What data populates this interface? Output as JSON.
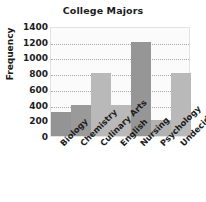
{
  "chart_data": {
    "type": "bar",
    "title": "College Majors",
    "xlabel": "",
    "ylabel": "Frequency",
    "categories": [
      "Biology",
      "Chemistry",
      "Culinary Arts",
      "English",
      "Nursing",
      "Psychology",
      "Undecided"
    ],
    "values": [
      300,
      400,
      800,
      400,
      1200,
      200,
      800
    ],
    "ylim": [
      0,
      1400
    ],
    "yticks": [
      "0",
      "200",
      "400",
      "600",
      "800",
      "1000",
      "1200",
      "1400"
    ],
    "ytick_values": [
      0,
      200,
      400,
      600,
      800,
      1000,
      1200,
      1400
    ],
    "gridlines": [
      200,
      400,
      600,
      800,
      1000,
      1200
    ],
    "grid": true,
    "grid_style": "dotted",
    "legend": false,
    "bar_colors": [
      "#949494",
      "#9a9a9a",
      "#b9b9b9",
      "#b9b9b9",
      "#969696",
      "#b2b2b2",
      "#b9b9b9"
    ],
    "plot_background": "#fbfbfb",
    "axis_color": "#e2e2e2",
    "text_color": "#1c1c1c",
    "tick_label_rotation": -45
  }
}
